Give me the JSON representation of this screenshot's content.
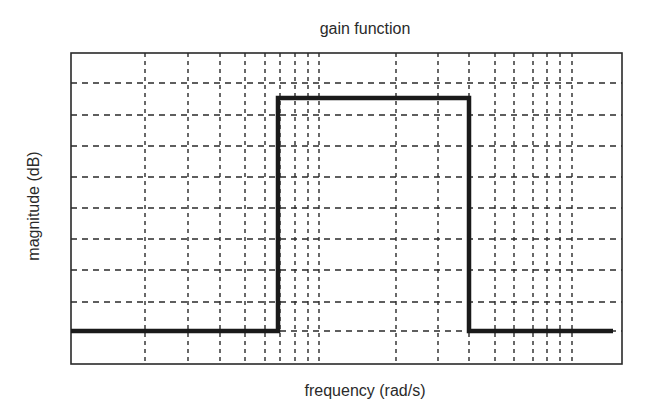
{
  "chart_data": {
    "type": "line",
    "title": "gain function",
    "xlabel": "frequency (rad/s)",
    "ylabel": "magnitude (dB)",
    "x_scale": "log",
    "x_tick_labels": [],
    "y_tick_labels": [],
    "grid": true,
    "grid_style": "dashed",
    "legend": null,
    "series": [
      {
        "name": "gain",
        "points_px": [
          [
            71,
            331
          ],
          [
            278,
            331
          ],
          [
            278,
            98
          ],
          [
            469,
            98
          ],
          [
            469,
            331
          ],
          [
            613,
            331
          ]
        ],
        "levels": {
          "stopband": "low",
          "passband": "high"
        },
        "passband_edges_px": [
          278,
          469
        ]
      }
    ],
    "plot_area_px": {
      "left": 71,
      "top": 53,
      "right": 622,
      "bottom": 364
    },
    "vertical_grid_px": [
      145,
      188,
      220,
      245,
      265,
      280,
      295,
      308,
      319,
      396,
      438,
      469,
      495,
      514,
      533,
      547,
      560,
      572
    ],
    "horizontal_grid_px": [
      83,
      115,
      146,
      177,
      208,
      239,
      270,
      302,
      331
    ]
  },
  "colors": {
    "line": "#1a1a1a",
    "grid": "#2a2a2a",
    "frame": "#2a2a2a",
    "background": "#ffffff"
  }
}
